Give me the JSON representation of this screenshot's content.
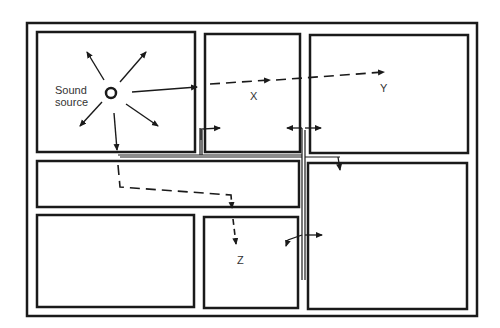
{
  "diagram": {
    "colors": {
      "line": "#1a1a1a",
      "background": "#ffffff",
      "text": "#333333"
    },
    "labels": {
      "source_line1": "Sound",
      "source_line2": "source",
      "x": "X",
      "y": "Y",
      "z": "Z"
    },
    "rooms": [
      {
        "id": "source-room",
        "x": 37,
        "y": 32,
        "w": 158,
        "h": 120
      },
      {
        "id": "room-x",
        "x": 205,
        "y": 34,
        "w": 95,
        "h": 118
      },
      {
        "id": "room-y",
        "x": 310,
        "y": 35,
        "w": 158,
        "h": 118
      },
      {
        "id": "corridor",
        "x": 37,
        "y": 161,
        "w": 262,
        "h": 46
      },
      {
        "id": "room-bottom-left",
        "x": 37,
        "y": 215,
        "w": 157,
        "h": 92
      },
      {
        "id": "room-z",
        "x": 204,
        "y": 217,
        "w": 94,
        "h": 91
      },
      {
        "id": "room-bottom-right",
        "x": 308,
        "y": 163,
        "w": 159,
        "h": 146
      }
    ],
    "paths": [
      {
        "name": "airborne-to-x",
        "style": "solid",
        "desc": "Direct sound through wall into room X"
      },
      {
        "name": "airborne-to-y",
        "style": "dashed",
        "desc": "Sound continues through X to Y"
      },
      {
        "name": "corridor-to-z",
        "style": "dashed",
        "desc": "Sound travels through corridor into Z"
      },
      {
        "name": "structure-borne",
        "style": "solid",
        "desc": "Flanking transmission via structure"
      }
    ]
  }
}
